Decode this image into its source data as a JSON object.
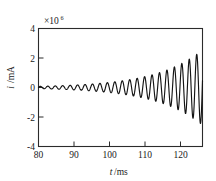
{
  "chart_data": {
    "type": "line",
    "title": "",
    "xlabel": "t/ms",
    "ylabel": "i/mA",
    "y_exponent_base": "×10",
    "y_exponent_power": "6",
    "y_scale_note": "×10⁶",
    "xlim": [
      80,
      125.6
    ],
    "ylim": [
      -4,
      4
    ],
    "xticks": [
      80,
      90,
      100,
      110,
      120
    ],
    "xtick_labels": [
      "80",
      "90",
      "100",
      "110",
      "120"
    ],
    "yticks": [
      -4,
      -2,
      0,
      2,
      4
    ],
    "ytick_labels": [
      "-4",
      "-2",
      "0",
      "2",
      "4"
    ],
    "grid": false,
    "legend": null,
    "series": [
      {
        "name": "i(t)",
        "color": "#141414",
        "description": "Exponentially growing sinusoidal oscillation starting near zero at t=80 ms and reaching about +2.5e6 mA at the right edge",
        "model": {
          "form": "A0 * exp((t - t0)/tau) * sin(2*pi*(t - t0)/period)",
          "t0": 80,
          "period_ms": 2.07,
          "amplitude_start": 0.075,
          "amplitude_end": 2.55,
          "growth": "exponential"
        },
        "points": [
          [
            80.0,
            0.0
          ],
          [
            80.5,
            0.05
          ],
          [
            81.0,
            0.07
          ],
          [
            81.6,
            0.02
          ],
          [
            82.1,
            -0.06
          ],
          [
            82.6,
            -0.07
          ],
          [
            83.1,
            -0.01
          ],
          [
            83.6,
            0.06
          ],
          [
            84.1,
            0.08
          ],
          [
            84.7,
            0.02
          ],
          [
            85.2,
            -0.06
          ],
          [
            85.7,
            -0.08
          ],
          [
            86.2,
            -0.01
          ],
          [
            86.7,
            0.07
          ],
          [
            87.2,
            0.09
          ],
          [
            87.8,
            0.02
          ],
          [
            88.3,
            -0.07
          ],
          [
            88.8,
            -0.09
          ],
          [
            89.3,
            -0.01
          ],
          [
            89.8,
            0.08
          ],
          [
            90.3,
            0.1
          ],
          [
            90.9,
            0.02
          ],
          [
            91.4,
            -0.08
          ],
          [
            91.9,
            -0.11
          ],
          [
            92.4,
            -0.01
          ],
          [
            92.9,
            0.09
          ],
          [
            93.4,
            0.12
          ],
          [
            94.0,
            0.03
          ],
          [
            94.5,
            -0.09
          ],
          [
            95.0,
            -0.13
          ],
          [
            95.5,
            -0.01
          ],
          [
            96.0,
            0.11
          ],
          [
            96.5,
            0.14
          ],
          [
            97.1,
            0.03
          ],
          [
            97.6,
            -0.11
          ],
          [
            98.1,
            -0.15
          ],
          [
            98.6,
            -0.02
          ],
          [
            99.1,
            0.12
          ],
          [
            99.6,
            0.17
          ],
          [
            100.2,
            0.03
          ],
          [
            100.7,
            -0.13
          ],
          [
            101.2,
            -0.19
          ],
          [
            101.7,
            -0.02
          ],
          [
            102.2,
            0.15
          ],
          [
            102.7,
            0.21
          ],
          [
            103.3,
            0.04
          ],
          [
            103.8,
            -0.17
          ],
          [
            104.3,
            -0.24
          ],
          [
            104.8,
            -0.02
          ],
          [
            105.3,
            0.19
          ],
          [
            105.8,
            0.27
          ],
          [
            106.4,
            0.05
          ],
          [
            106.9,
            -0.21
          ],
          [
            107.4,
            -0.31
          ],
          [
            107.9,
            -0.03
          ],
          [
            108.4,
            0.24
          ],
          [
            108.9,
            0.35
          ],
          [
            109.5,
            0.06
          ],
          [
            110.0,
            -0.28
          ],
          [
            110.5,
            -0.41
          ],
          [
            111.0,
            -0.04
          ],
          [
            111.5,
            0.33
          ],
          [
            112.0,
            0.48
          ],
          [
            112.6,
            0.08
          ],
          [
            113.1,
            -0.39
          ],
          [
            113.6,
            -0.57
          ],
          [
            114.1,
            -0.05
          ],
          [
            114.6,
            0.47
          ],
          [
            115.1,
            0.68
          ],
          [
            115.7,
            0.1
          ],
          [
            116.2,
            -0.57
          ],
          [
            116.7,
            -0.83
          ],
          [
            117.2,
            -0.07
          ],
          [
            117.7,
            0.7
          ],
          [
            118.2,
            1.02
          ],
          [
            118.8,
            0.14
          ],
          [
            119.3,
            -0.88
          ],
          [
            119.8,
            -1.28
          ],
          [
            120.3,
            -0.1
          ],
          [
            120.8,
            1.1
          ],
          [
            121.3,
            1.6
          ],
          [
            121.9,
            0.22
          ],
          [
            122.4,
            -1.4
          ],
          [
            122.9,
            -2.05
          ],
          [
            123.4,
            -0.16
          ],
          [
            123.9,
            1.78
          ],
          [
            124.4,
            2.1
          ],
          [
            125.0,
            -0.3
          ],
          [
            125.3,
            -2.3
          ],
          [
            125.6,
            2.55
          ]
        ]
      }
    ]
  },
  "axes": {
    "x_axis_title": "t/ms",
    "x_axis_var": "t",
    "x_axis_unit": "/ms",
    "y_axis_title": "i/mA",
    "y_axis_var": "i",
    "y_axis_unit": "/mA"
  }
}
